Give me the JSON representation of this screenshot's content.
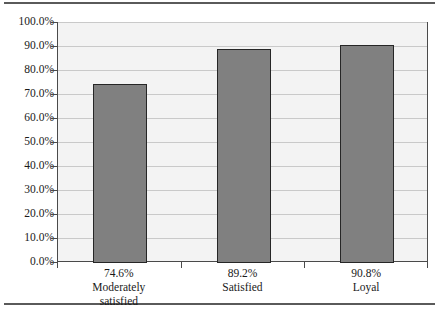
{
  "chart_data": {
    "type": "bar",
    "title": "",
    "subtitle": "",
    "xlabel": "",
    "ylabel": "",
    "categories": [
      "Moderately\nsatisfied",
      "Satisfied",
      "Loyal"
    ],
    "value_labels": [
      "74.6%",
      "89.2%",
      "90.8%"
    ],
    "values": [
      74.6,
      89.2,
      90.8
    ],
    "ylim": [
      0,
      100
    ],
    "ytick_labels": [
      "0.0%",
      "10.0%",
      "20.0%",
      "30.0%",
      "40.0%",
      "50.0%",
      "60.0%",
      "70.0%",
      "80.0%",
      "90.0%",
      "100.0%"
    ],
    "ytick_values": [
      0,
      10,
      20,
      30,
      40,
      50,
      60,
      70,
      80,
      90,
      100
    ],
    "grid": true,
    "legend": false,
    "legend_position": "none",
    "series": [
      {
        "name": "",
        "values": [
          74.6,
          89.2,
          90.8
        ]
      }
    ],
    "colors": {
      "bar_fill": "#808080",
      "bar_border": "#262626",
      "plot_background": "#f3f3f3",
      "gridline": "#c9c9c9",
      "axis": "#4a4a4a",
      "text": "#1a1a1a",
      "page_rule": "#5a5a5a"
    }
  },
  "figure": {
    "rule_top": "",
    "rule_bottom": ""
  }
}
